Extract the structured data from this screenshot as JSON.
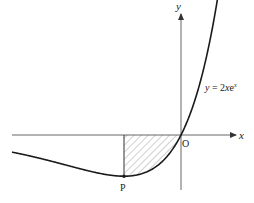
{
  "diagram": {
    "curve_equation_prefix": "y = 2",
    "curve_equation_x": "x",
    "curve_equation_e": "e",
    "curve_equation_exp": "x",
    "x_axis_label": "x",
    "y_axis_label": "y",
    "origin_label": "O",
    "point_label": "P",
    "function": "2*x*exp(x)",
    "point_P": {
      "x": -1,
      "y": -0.7358
    },
    "shaded_region": {
      "from_x": -1,
      "to_x": 0,
      "description": "region between curve and x-axis from P to O"
    },
    "colors": {
      "curve": "#1a1a1a",
      "axes": "#555555",
      "hatch": "#8a8a8a"
    }
  }
}
